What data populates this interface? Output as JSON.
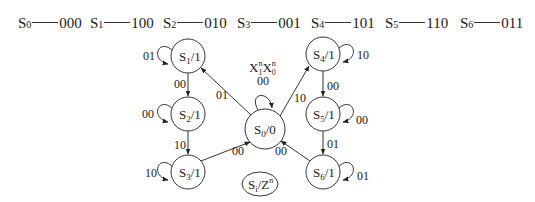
{
  "encoding": [
    {
      "state": "S",
      "sub": "0",
      "code": "000"
    },
    {
      "state": "S",
      "sub": "1",
      "code": "100"
    },
    {
      "state": "S",
      "sub": "2",
      "code": "010"
    },
    {
      "state": "S",
      "sub": "3",
      "code": "001"
    },
    {
      "state": "S",
      "sub": "4",
      "code": "101"
    },
    {
      "state": "S",
      "sub": "5",
      "code": "110"
    },
    {
      "state": "S",
      "sub": "6",
      "code": "011"
    }
  ],
  "input_label": {
    "x1": "X",
    "x1_sub": "1",
    "x1_sup": "n",
    "x0": "X",
    "x0_sub": "0",
    "x0_sup": "n"
  },
  "legend": {
    "state": "S",
    "sub": "i",
    "sep": "/Z",
    "sup": "n"
  },
  "states": [
    {
      "id": "S0",
      "name": "S",
      "sub": "0",
      "output": "/0"
    },
    {
      "id": "S1",
      "name": "S",
      "sub": "1",
      "output": "/1"
    },
    {
      "id": "S2",
      "name": "S",
      "sub": "2",
      "output": "/1"
    },
    {
      "id": "S3",
      "name": "S",
      "sub": "3",
      "output": "/1"
    },
    {
      "id": "S4",
      "name": "S",
      "sub": "4",
      "output": "/1"
    },
    {
      "id": "S5",
      "name": "S",
      "sub": "5",
      "output": "/1"
    },
    {
      "id": "S6",
      "name": "S",
      "sub": "6",
      "output": "/1"
    }
  ],
  "transitions": {
    "s0_self": "00",
    "s0_to_s1": "01",
    "s0_to_s4": "10",
    "s1_self": "01",
    "s1_to_s2": "00",
    "s2_self": "00",
    "s2_to_s3": "10",
    "s3_self": "10",
    "s3_to_s0": "00",
    "s4_self": "10",
    "s4_to_s5": "00",
    "s5_self": "00",
    "s5_to_s6": "01",
    "s6_self": "01",
    "s6_to_s0": "00"
  }
}
